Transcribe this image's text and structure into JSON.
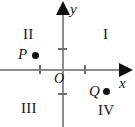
{
  "figure": {
    "type": "cartesian-coordinate-plane",
    "background_color": "#ffffff",
    "axis_color": "#8d8d8d",
    "tick_color": "#6f6f6f",
    "ink_color": "#111111"
  },
  "axes": {
    "y_label": "y",
    "x_label": "x",
    "origin_label": "O",
    "x_ticks": [
      -1,
      1
    ],
    "y_ticks": [
      -1,
      1
    ]
  },
  "quadrants": [
    {
      "id": "i",
      "label": "I"
    },
    {
      "id": "ii",
      "label": "II"
    },
    {
      "id": "iii",
      "label": "III"
    },
    {
      "id": "iv",
      "label": "IV"
    }
  ],
  "points": [
    {
      "id": "p",
      "label": "P",
      "quadrant": "II"
    },
    {
      "id": "q",
      "label": "Q",
      "quadrant": "IV"
    }
  ],
  "chart_data": {
    "type": "scatter",
    "title": "",
    "xlabel": "x",
    "ylabel": "y",
    "xlim": [
      -1.55,
      1.55
    ],
    "ylim": [
      -1.45,
      1.6
    ],
    "grid": false,
    "legend": null,
    "xticks": [
      -1,
      1
    ],
    "yticks": [
      -1,
      1
    ],
    "xticklabels": [
      "",
      ""
    ],
    "yticklabels": [
      "",
      ""
    ],
    "series": [
      {
        "name": "labeled points",
        "points": [
          {
            "label": "P",
            "x": -0.7,
            "y": 0.38
          },
          {
            "label": "Q",
            "x": 0.95,
            "y": -0.42
          }
        ]
      }
    ],
    "annotations": [
      {
        "text": "I",
        "x": 0.95,
        "y": 0.92,
        "role": "quadrant-label"
      },
      {
        "text": "II",
        "x": -0.85,
        "y": 0.92,
        "role": "quadrant-label"
      },
      {
        "text": "III",
        "x": -0.92,
        "y": -0.72,
        "role": "quadrant-label"
      },
      {
        "text": "IV",
        "x": 0.82,
        "y": -0.78,
        "role": "quadrant-label"
      },
      {
        "text": "O",
        "x": -0.17,
        "y": -0.1,
        "role": "origin-label"
      }
    ]
  }
}
